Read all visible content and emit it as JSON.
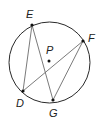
{
  "diagram": {
    "type": "circle-with-chords",
    "circle": {
      "center": "P",
      "cx": 49.5,
      "cy": 62.5,
      "r": 40.5,
      "stroke": "#2a2a2a"
    },
    "center_point": {
      "label": "P",
      "x": 49,
      "y": 61,
      "label_x": 47,
      "label_y": 54
    },
    "points": [
      {
        "label": "E",
        "x": 32,
        "y": 25,
        "label_x": 26,
        "label_y": 18
      },
      {
        "label": "F",
        "x": 83,
        "y": 41,
        "label_x": 88,
        "label_y": 42
      },
      {
        "label": "D",
        "x": 23,
        "y": 91,
        "label_x": 16,
        "label_y": 107
      },
      {
        "label": "G",
        "x": 53,
        "y": 100,
        "label_x": 49,
        "label_y": 117
      }
    ],
    "chords": [
      {
        "from": "E",
        "to": "D"
      },
      {
        "from": "E",
        "to": "G"
      },
      {
        "from": "D",
        "to": "F"
      },
      {
        "from": "F",
        "to": "G"
      }
    ],
    "chord_color": "#6b6b6b"
  }
}
